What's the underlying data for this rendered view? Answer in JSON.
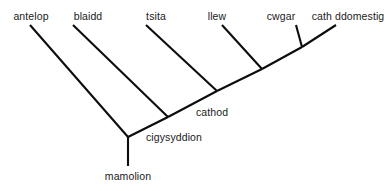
{
  "diagram": {
    "type": "cladogram",
    "title": "",
    "language": "Welsh",
    "background_color": "#ffffff",
    "line_color": "#0d0d0d",
    "text_color": "#1a1a1a"
  },
  "leaves": [
    {
      "id": "antelop",
      "label": "antelop",
      "x": 31,
      "y": 17
    },
    {
      "id": "blaidd",
      "label": "blaidd",
      "x": 88,
      "y": 17
    },
    {
      "id": "tsita",
      "label": "tsita",
      "x": 156,
      "y": 17
    },
    {
      "id": "llew",
      "label": "llew",
      "x": 217,
      "y": 17
    },
    {
      "id": "cwgar",
      "label": "cwgar",
      "x": 281,
      "y": 17
    },
    {
      "id": "cath-ddomestig",
      "label": "cath ddomestig",
      "x": 347,
      "y": 17
    }
  ],
  "nodes": [
    {
      "id": "mamolion",
      "label": "mamolion",
      "x": 128,
      "y": 174
    },
    {
      "id": "cigysyddion",
      "label": "cigysyddion",
      "x": 175,
      "y": 137
    },
    {
      "id": "cathod",
      "label": "cathod",
      "x": 215,
      "y": 112
    }
  ],
  "branches": [
    {
      "id": "root-stem",
      "from": "mamolion-base",
      "to": "mamolion-node",
      "points": "128,166 128,137"
    },
    {
      "id": "branch-antelop",
      "from": "mamolion-node",
      "to": "antelop",
      "points": "128,137 30,25"
    },
    {
      "id": "branch-to-carnivores",
      "from": "mamolion-node",
      "to": "cigysyddion",
      "points": "128,137 168,117"
    },
    {
      "id": "branch-blaidd",
      "from": "cigysyddion",
      "to": "blaidd",
      "points": "168,117 73,25"
    },
    {
      "id": "branch-to-cats",
      "from": "cigysyddion",
      "to": "cathod",
      "points": "168,117 217,91"
    },
    {
      "id": "branch-tsita",
      "from": "cathod",
      "to": "tsita",
      "points": "217,91 146,25"
    },
    {
      "id": "branch-cathod-up",
      "from": "cathod",
      "to": "llew-node",
      "points": "217,91 262,69"
    },
    {
      "id": "branch-llew",
      "from": "llew-node",
      "to": "llew",
      "points": "262,69 222,25"
    },
    {
      "id": "branch-llew-node-up",
      "from": "llew-node",
      "to": "cwgar-node",
      "points": "262,69 302,47"
    },
    {
      "id": "branch-cwgar",
      "from": "cwgar-node",
      "to": "cwgar",
      "points": "302,47 296,25"
    },
    {
      "id": "branch-cath-dom",
      "from": "cwgar-node",
      "to": "cath-ddomestig",
      "points": "302,47 336,25"
    }
  ]
}
